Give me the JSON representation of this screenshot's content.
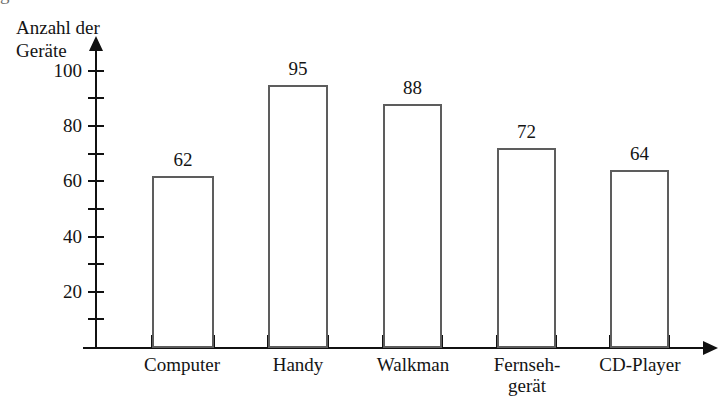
{
  "chart_data": {
    "type": "bar",
    "title": "",
    "xlabel": "",
    "ylabel": "Anzahl der\nGeräte",
    "categories": [
      "Computer",
      "Handy",
      "Walkman",
      "Fernseh-\ngerät",
      "CD-Player"
    ],
    "values": [
      62,
      95,
      88,
      72,
      64
    ],
    "value_labels": [
      "62",
      "95",
      "88",
      "72",
      "64"
    ],
    "ylim": [
      0,
      105
    ],
    "ytick_labels": [
      "20",
      "40",
      "60",
      "80",
      "100"
    ],
    "ytick_values": [
      20,
      40,
      60,
      80,
      100
    ],
    "minor_ytick_values": [
      10,
      30,
      50,
      70,
      90
    ],
    "grid": false,
    "legend": false,
    "colors": {
      "bar_fill": "#ffffff",
      "bar_border": "#5d5d5d",
      "axis": "#111111",
      "text": "#141414",
      "background": "#ffffff"
    }
  },
  "artifacts": {
    "top_cut_text": "g"
  }
}
